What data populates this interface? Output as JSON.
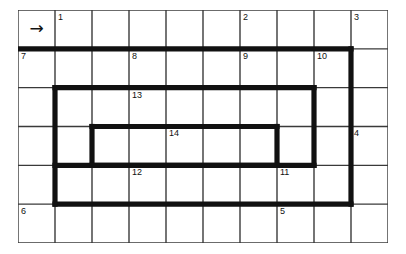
{
  "puzzle": {
    "type": "grid-path-puzzle",
    "grid": {
      "columns": 10,
      "rows": 6,
      "cell_width": 37,
      "cell_height": 38.8,
      "origin_x": 18,
      "origin_y": 10,
      "thin_line_color": "#3a3a3a",
      "thin_line_width": 1.4,
      "thick_line_color": "#111111",
      "thick_line_width": 5.2,
      "background_color": "#ffffff"
    },
    "start_marker": {
      "label": "→",
      "icon": "arrow-right-icon",
      "col": 0,
      "row": 0
    },
    "cell_numbers": [
      {
        "label": "1",
        "col": 1,
        "row": 0
      },
      {
        "label": "2",
        "col": 6,
        "row": 0
      },
      {
        "label": "3",
        "col": 9,
        "row": 0
      },
      {
        "label": "7",
        "col": 0,
        "row": 1
      },
      {
        "label": "8",
        "col": 3,
        "row": 1
      },
      {
        "label": "9",
        "col": 6,
        "row": 1
      },
      {
        "label": "10",
        "col": 8,
        "row": 1
      },
      {
        "label": "13",
        "col": 3,
        "row": 2
      },
      {
        "label": "4",
        "col": 9,
        "row": 3
      },
      {
        "label": "14",
        "col": 4,
        "row": 3
      },
      {
        "label": "12",
        "col": 3,
        "row": 4
      },
      {
        "label": "11",
        "col": 7,
        "row": 4
      },
      {
        "label": "6",
        "col": 0,
        "row": 5
      },
      {
        "label": "5",
        "col": 7,
        "row": 5
      }
    ],
    "thick_paths": [
      {
        "name": "outer-top-run",
        "points": "0,1 9,1"
      },
      {
        "name": "outer-right-run",
        "points": "9,1 9,5"
      },
      {
        "name": "outer-bottom-run",
        "points": "9,5 1,5"
      },
      {
        "name": "loop-left-run",
        "points": "1,2 1,5"
      },
      {
        "name": "loop-top-run",
        "points": "1,2 8,2"
      },
      {
        "name": "loop-right-run",
        "points": "8,2 8,4"
      },
      {
        "name": "loop-bottom-run",
        "points": "8,4 1,4"
      },
      {
        "name": "inner-left-run",
        "points": "2,3 2,4"
      },
      {
        "name": "inner-top-run",
        "points": "2,3 7,3"
      },
      {
        "name": "inner-right-run",
        "points": "7,3 7,4"
      },
      {
        "name": "inner-bottom-run",
        "points": "7,4 2,4"
      }
    ]
  }
}
